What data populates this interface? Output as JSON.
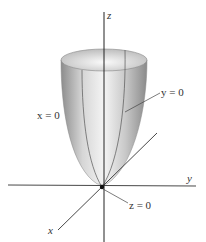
{
  "diagram": {
    "type": "3d-surface",
    "surface": "elliptic paraboloid",
    "axes": {
      "x_label": "x",
      "y_label": "y",
      "z_label": "z"
    },
    "trace_labels": {
      "x0": "x = 0",
      "y0": "y = 0",
      "z0": "z = 0"
    },
    "colors": {
      "surface_light": "#f2f2f2",
      "surface_dark": "#8a8a8a",
      "axis": "#222222"
    }
  }
}
